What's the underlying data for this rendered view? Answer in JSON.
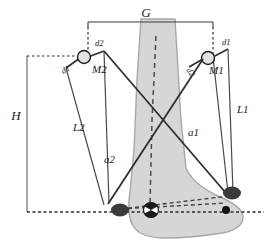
{
  "diagram": {
    "labels": {
      "gap_top": "G",
      "height_left": "H",
      "link_left": "L2",
      "link_right": "L1",
      "actuator_left": "a2",
      "actuator_right": "a1",
      "motor_left": "M2",
      "motor_right": "M1",
      "offset_left_lower": "d1",
      "offset_left_upper": "d2",
      "offset_right_upper": "d1",
      "offset_right_lower": "d2"
    },
    "colors": {
      "leg_fill": "#d6d6d6",
      "leg_stroke": "#a8a8a8",
      "line": "#3a3a3a",
      "joint_dark": "#333333",
      "joint_open_fill": "#e2e2e2",
      "dash": "#2b2b2b",
      "background": "#ffffff"
    },
    "elements": {
      "leg_shape": "tapered-lower-leg-with-foot",
      "center_line": "dashed-tibia-axis",
      "baseline": "dashed-ground-reference",
      "ankle_marker": "hatched-circle",
      "heel_joint": "dark-ellipse",
      "toe_joint": "dark-ellipse",
      "forefoot_point": "small-black-dot"
    }
  }
}
